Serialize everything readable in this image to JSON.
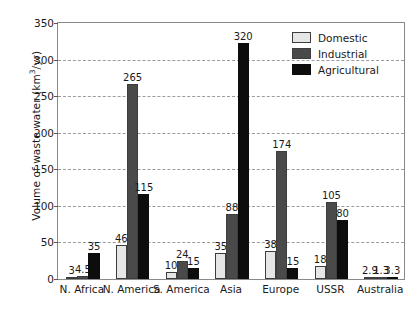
{
  "chart_data": {
    "type": "bar",
    "title": "",
    "xlabel": "",
    "ylabel": "Volume of waste water (km3/yr)",
    "ylabel_parts": {
      "pre": "Volume of waste water (km",
      "sup": "3",
      "post": "/yr)"
    },
    "ylim": [
      0,
      350
    ],
    "ytick_labels": [
      "0",
      "50",
      "100",
      "150",
      "200",
      "250",
      "300",
      "350"
    ],
    "ytick_values": [
      0,
      50,
      100,
      150,
      200,
      250,
      300,
      350
    ],
    "grid": true,
    "grid_style": "dashed-horizontal",
    "legend_position": "top-right",
    "categories": [
      "N. Africa",
      "N. America",
      "S. America",
      "Asia",
      "Europe",
      "USSR",
      "Australia"
    ],
    "series": [
      {
        "name": "Domestic",
        "color": "#e6e6e6",
        "values": [
          3,
          46,
          10,
          35,
          38,
          18,
          2.9
        ],
        "labels": [
          "3",
          "46",
          "10",
          "35",
          "38",
          "18",
          "2.9"
        ]
      },
      {
        "name": "Industrial",
        "color": "#4a4a4a",
        "values": [
          4.5,
          265,
          24,
          88,
          174,
          105,
          1.3
        ],
        "labels": [
          "4.5",
          "265",
          "24",
          "88",
          "174",
          "105",
          "1.3"
        ]
      },
      {
        "name": "Agricultural",
        "color": "#0d0d0d",
        "values": [
          35,
          115,
          15,
          320,
          15,
          80,
          3.3
        ],
        "labels": [
          "35",
          "115",
          "15",
          "320",
          "15",
          "80",
          "3.3"
        ]
      }
    ]
  },
  "legend": {
    "items": [
      {
        "label": "Domestic",
        "key": "domestic"
      },
      {
        "label": "Industrial",
        "key": "industrial"
      },
      {
        "label": "Agricultural",
        "key": "agricultural"
      }
    ]
  },
  "axis_colors": {
    "frame": "#8a8a8a",
    "gridline": "#9b9b9b",
    "text": "#1a1a1a"
  }
}
